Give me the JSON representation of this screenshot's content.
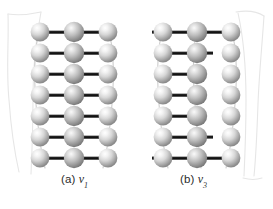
{
  "figure": {
    "background_color": "#ffffff",
    "panels": [
      {
        "id": "panel-a",
        "caption_prefix": "(a)",
        "variable": "v",
        "subscript": "1",
        "origin_x": 38,
        "origin_y": 32,
        "rows": 7,
        "columns": 3,
        "row_spacing": 21,
        "column_spacing": 34,
        "bond_pattern": "all-rows-full",
        "full_bond_rows": [
          0,
          1,
          2,
          3,
          4,
          5,
          6
        ],
        "left_bond_rows": [],
        "left_stub_rows": [],
        "strand_left": true,
        "strand_right": true
      },
      {
        "id": "panel-b",
        "caption_prefix": "(b)",
        "variable": "v",
        "subscript": "3",
        "origin_x": 161,
        "origin_y": 32,
        "rows": 7,
        "columns": 3,
        "row_spacing": 21,
        "column_spacing": 34,
        "bond_pattern": "alternating",
        "full_bond_rows": [
          0,
          6
        ],
        "left_bond_rows": [
          1,
          2,
          3,
          4,
          5
        ],
        "left_stub_rows": [
          0,
          1,
          6
        ],
        "strand_left": true,
        "strand_right": true
      }
    ],
    "sphere": {
      "radius": 9.5,
      "highlight_color": "#fdfdfd",
      "mid_color": "#d2d2d2",
      "edge_color": "#8e8e8e",
      "shadow_color": "#6f6f6f",
      "label": "atom-sphere"
    },
    "bond": {
      "color": "#1c1c1c",
      "highlight_color": "#707070",
      "thickness": 3.2,
      "label": "bond-link"
    },
    "strand": {
      "color": "#cfcfcf",
      "thickness": 1.0,
      "label": "chain-strand"
    },
    "outline_curve": {
      "color": "#e3e3e3",
      "thickness": 1.1,
      "left_label": "left-outline-curve",
      "right_label": "right-outline-curve"
    }
  }
}
